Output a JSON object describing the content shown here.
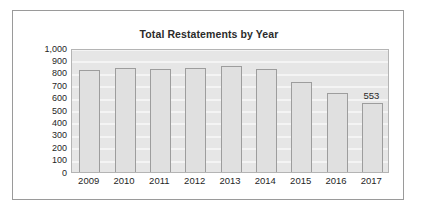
{
  "chart_data": {
    "type": "bar",
    "title": "Total Restatements by Year",
    "xlabel": "",
    "ylabel": "",
    "categories": [
      "2009",
      "2010",
      "2011",
      "2012",
      "2013",
      "2014",
      "2015",
      "2016",
      "2017"
    ],
    "values": [
      825,
      840,
      832,
      838,
      855,
      832,
      722,
      640,
      553
    ],
    "ylim": [
      0,
      1000
    ],
    "ytick_labels": [
      "1,000",
      "900",
      "800",
      "700",
      "600",
      "500",
      "400",
      "300",
      "200",
      "100",
      "0"
    ],
    "ytick_values": [
      1000,
      900,
      800,
      700,
      600,
      500,
      400,
      300,
      200,
      100,
      0
    ],
    "grid": true,
    "legend": false,
    "data_labels": [
      {
        "category": "2017",
        "value": 553,
        "text": "553"
      }
    ],
    "colors": {
      "bar_fill": "#e0e0e0",
      "bar_outline": "#9d9d9d",
      "plot_background": "#e6e6e6",
      "gridline": "#f4f4f4",
      "frame_border": "#9a9a9a",
      "text": "#1f1f1f",
      "title_text": "#2b2b2b"
    }
  }
}
